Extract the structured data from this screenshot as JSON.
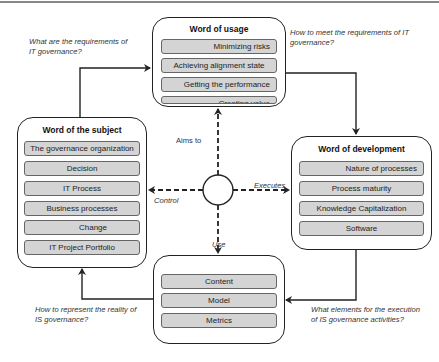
{
  "questions": {
    "top_left": "What are the requirements of IT governance?",
    "top_left_l1": "What are the requirements of",
    "top_left_l2": "IT governance?",
    "top_right_l1": "How to meet the requirements of IT",
    "top_right_l2": "governance?",
    "bottom_left_l1": "How to represent the reality of",
    "bottom_left_l2": "IS governance?",
    "bottom_right_l1": "What elements for the execution",
    "bottom_right_l2": "of IS governance activities?"
  },
  "boxes": {
    "usage": {
      "title": "Word of usage",
      "items": [
        "Minimizing risks",
        "Achieving alignment state",
        "Getting the performance",
        "Creating value"
      ]
    },
    "subject": {
      "title": "Word of the subject",
      "items": [
        "The governance organization",
        "Decision",
        "IT Process",
        "Business processes",
        "Change",
        "IT Project Portfolio"
      ]
    },
    "development": {
      "title": "Word of development",
      "items": [
        "Nature of processes",
        "Process maturity",
        "Knowledge Capitalization",
        "Software"
      ]
    },
    "system": {
      "title": "",
      "items": [
        "Content",
        "Model",
        "Metrics"
      ]
    }
  },
  "center_links": {
    "up": "Aims to",
    "left": "Control",
    "right": "Executes",
    "down": "Use"
  },
  "colors": {
    "item_fill": "#d4d4d4",
    "border": "#222222"
  }
}
